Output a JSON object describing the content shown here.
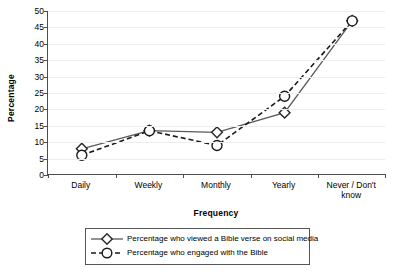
{
  "chart_data": {
    "type": "line",
    "title": "",
    "subtitle": "",
    "xlabel": "Frequency",
    "ylabel": "Percentage",
    "categories": [
      "Daily",
      "Weekly",
      "Monthly",
      "Yearly",
      "Never / Don't know"
    ],
    "ylim": [
      0,
      50
    ],
    "ytick_step": 5,
    "yticks": [
      0,
      5,
      10,
      15,
      20,
      25,
      30,
      35,
      40,
      45,
      50
    ],
    "ytick_labels": [
      "0",
      "5",
      "10",
      "15",
      "20",
      "25",
      "30",
      "35",
      "40",
      "45",
      "50"
    ],
    "grid": true,
    "grid_axis": "y",
    "legend_position": "bottom",
    "series": [
      {
        "name": "Percentage who viewed a Bible verse on social media",
        "values": [
          8,
          13.5,
          13,
          19,
          47
        ],
        "marker": "diamond",
        "linestyle": "solid",
        "color": "#595959",
        "marker_fill": "#ffffff",
        "marker_edge": "#262626"
      },
      {
        "name": "Percentage who engaged with the Bible",
        "values": [
          6,
          13.5,
          9,
          24,
          47
        ],
        "marker": "circle",
        "linestyle": "dashed",
        "color": "#1a1a1a",
        "marker_fill": "#ffffff",
        "marker_edge": "#1a1a1a"
      }
    ]
  },
  "axes": {
    "y_title": "Percentage",
    "x_title": "Frequency"
  },
  "legend": {
    "entries": [
      {
        "label": "Percentage who viewed a Bible verse on social media",
        "marker": "diamond-marker",
        "linestyle": "solid"
      },
      {
        "label": "Percentage who engaged with the Bible",
        "marker": "circle-marker",
        "linestyle": "dashed"
      }
    ]
  },
  "colors": {
    "axis": "#4d4d4d",
    "gridline": "#eeeeee",
    "series_1": "#595959",
    "series_2": "#1a1a1a",
    "legend_border": "#555555",
    "background": "#ffffff"
  }
}
